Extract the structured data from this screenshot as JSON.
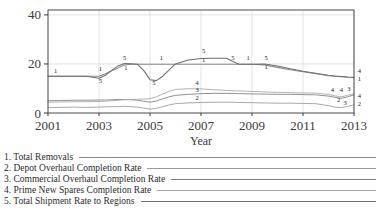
{
  "chart_data": {
    "type": "line",
    "title": "",
    "xlabel": "Year",
    "ylabel": "",
    "xlim": [
      2001,
      2013
    ],
    "ylim": [
      0,
      42
    ],
    "grid": true,
    "legend_position": "below",
    "xticks": [
      "2001",
      "2003",
      "2005",
      "2007",
      "2009",
      "2011",
      "2013"
    ],
    "xtick_values": [
      2001,
      2003,
      2005,
      2007,
      2009,
      2011,
      2013
    ],
    "yticks": [
      "0",
      "20",
      "40"
    ],
    "ytick_values": [
      0,
      20,
      40
    ],
    "x": [
      2001.0,
      2001.5,
      2002.0,
      2002.5,
      2003.0,
      2003.25,
      2003.5,
      2003.75,
      2004.0,
      2004.25,
      2004.5,
      2004.75,
      2005.0,
      2005.25,
      2005.5,
      2005.75,
      2006.0,
      2006.5,
      2007.0,
      2007.5,
      2008.0,
      2008.25,
      2008.5,
      2009.0,
      2009.5,
      2010.0,
      2010.5,
      2011.0,
      2011.5,
      2012.0,
      2012.25,
      2012.5,
      2012.75,
      2013.0
    ],
    "series": [
      {
        "name": "Total Removals",
        "number": 1,
        "color": "#8a8a8a",
        "values": [
          15.0,
          15.0,
          15.0,
          15.0,
          15.0,
          16.0,
          17.2,
          18.4,
          19.6,
          19.9,
          19.9,
          19.9,
          19.9,
          19.9,
          19.9,
          19.9,
          19.9,
          19.9,
          19.9,
          19.9,
          19.9,
          19.9,
          19.9,
          19.9,
          19.6,
          18.6,
          17.6,
          16.8,
          16.0,
          15.2,
          15.0,
          14.8,
          14.6,
          14.5
        ]
      },
      {
        "name": "Depot Overhaul Completion Rate",
        "number": 2,
        "color": "#9a9a9a",
        "values": [
          2.2,
          2.3,
          2.4,
          2.3,
          2.4,
          2.5,
          2.6,
          2.6,
          2.7,
          2.6,
          2.4,
          2.0,
          1.6,
          1.9,
          2.6,
          3.3,
          3.8,
          4.1,
          4.3,
          4.4,
          4.4,
          4.4,
          4.3,
          4.2,
          4.1,
          4.0,
          4.0,
          3.9,
          3.8,
          3.0,
          2.4,
          2.2,
          2.7,
          3.3
        ]
      },
      {
        "name": "Commercial Overhaul Completion Rate",
        "number": 3,
        "color": "#7d7d7d",
        "values": [
          5.0,
          5.1,
          5.2,
          5.2,
          5.3,
          5.3,
          5.4,
          5.5,
          5.5,
          5.4,
          5.2,
          4.8,
          4.4,
          4.9,
          5.8,
          6.6,
          7.2,
          7.6,
          7.9,
          8.0,
          8.0,
          8.0,
          7.9,
          7.8,
          7.7,
          7.6,
          7.6,
          7.5,
          7.4,
          6.9,
          6.4,
          6.0,
          6.6,
          7.4
        ]
      },
      {
        "name": "Prime New Spares Completion Rate",
        "number": 4,
        "color": "#a5a5a5",
        "values": [
          4.4,
          4.5,
          4.6,
          4.6,
          4.7,
          4.8,
          5.0,
          5.2,
          5.4,
          5.5,
          5.6,
          5.7,
          5.8,
          6.6,
          7.8,
          8.8,
          9.6,
          9.9,
          9.8,
          9.5,
          9.2,
          9.1,
          9.0,
          8.8,
          8.6,
          8.4,
          8.3,
          8.2,
          8.1,
          7.6,
          7.0,
          6.6,
          7.2,
          7.9
        ]
      },
      {
        "name": "Total Shipment Rate to Regions",
        "number": 5,
        "color": "#6f6f6f",
        "values": [
          15.0,
          15.0,
          15.0,
          15.0,
          14.2,
          15.4,
          17.4,
          19.2,
          20.2,
          20.1,
          19.9,
          17.4,
          13.6,
          13.2,
          15.0,
          17.6,
          20.0,
          21.6,
          22.2,
          22.3,
          22.3,
          21.0,
          19.9,
          19.9,
          20.0,
          19.2,
          18.0,
          17.0,
          16.2,
          15.4,
          15.1,
          14.9,
          14.7,
          14.6
        ]
      }
    ],
    "inline_labels": [
      {
        "text": "1",
        "x": 2001.3,
        "y": 16.3
      },
      {
        "text": "1",
        "x": 2003.05,
        "y": 17.3
      },
      {
        "text": "5",
        "x": 2003.05,
        "y": 12.4
      },
      {
        "text": "5",
        "x": 2004.0,
        "y": 21.6
      },
      {
        "text": "1",
        "x": 2004.05,
        "y": 17.6
      },
      {
        "text": "5",
        "x": 2005.15,
        "y": 11.5
      },
      {
        "text": "1",
        "x": 2005.45,
        "y": 21.6
      },
      {
        "text": "5",
        "x": 2007.1,
        "y": 24.4
      },
      {
        "text": "1",
        "x": 2007.1,
        "y": 20.9
      },
      {
        "text": "4",
        "x": 2006.85,
        "y": 11.6
      },
      {
        "text": "3",
        "x": 2006.85,
        "y": 8.6
      },
      {
        "text": "2",
        "x": 2006.85,
        "y": 5.3
      },
      {
        "text": "5",
        "x": 2008.25,
        "y": 21.5
      },
      {
        "text": "1",
        "x": 2008.85,
        "y": 21.6
      },
      {
        "text": "5",
        "x": 2009.55,
        "y": 21.7
      },
      {
        "text": "1",
        "x": 2009.55,
        "y": 18.0
      },
      {
        "text": "4",
        "x": 2012.15,
        "y": 8.5
      },
      {
        "text": "4",
        "x": 2012.5,
        "y": 8.5
      },
      {
        "text": "3",
        "x": 2012.8,
        "y": 8.8
      },
      {
        "text": "2",
        "x": 2012.4,
        "y": 4.3
      },
      {
        "text": "3",
        "x": 2012.65,
        "y": 3.2
      }
    ],
    "edge_labels": [
      {
        "text": "4",
        "x": 2013.15,
        "y": 16.3
      },
      {
        "text": "1",
        "x": 2013.15,
        "y": 13.2
      },
      {
        "text": "4",
        "x": 2013.15,
        "y": 6.0
      },
      {
        "text": "2",
        "x": 2013.15,
        "y": 2.9
      }
    ]
  },
  "legend": {
    "items": [
      {
        "index": "1.",
        "label": "1. Total Removals"
      },
      {
        "index": "2.",
        "label": "2. Depot Overhaul Completion Rate"
      },
      {
        "index": "3.",
        "label": "3. Commercial Overhaul Completion Rate"
      },
      {
        "index": "4.",
        "label": "4. Prime New Spares Completion Rate"
      },
      {
        "index": "5.",
        "label": "5. Total Shipment Rate to Regions"
      }
    ]
  },
  "colors": {
    "axis": "#3a3a3a",
    "grid": "#d8d8d8",
    "background": "#ffffff",
    "text": "#2b2b2b"
  }
}
